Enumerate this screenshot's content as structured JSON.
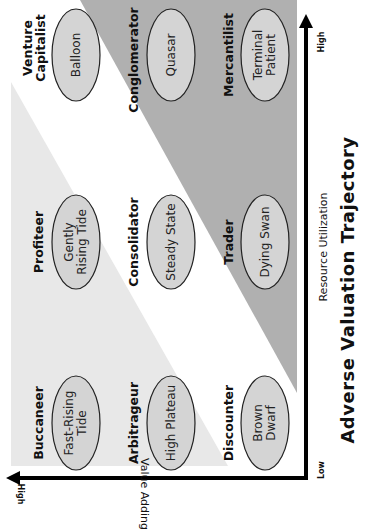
{
  "title": "Adverse Valuation Trajectory",
  "colors": {
    "background": "#ffffff",
    "light_region": "#e8e8e8",
    "dark_region": "#b0b0b0",
    "ellipse_fill": "#d4d4d4",
    "axis": "#000000"
  },
  "axes": {
    "x": {
      "label": "Resource Utilization",
      "low": "Low",
      "high": "High"
    },
    "y": {
      "label": "Value Adding",
      "low": "",
      "high": "High"
    }
  },
  "grid": {
    "rows": [
      {
        "position": "top",
        "cells": [
          {
            "segment": "Venture Capitalist",
            "segment_lines": [
              "Venture",
              "Capitalist"
            ],
            "trajectory": "Balloon",
            "trajectory_lines": [
              "Balloon"
            ]
          },
          {
            "segment": "Conglomerator",
            "segment_lines": [
              "Conglomerator"
            ],
            "trajectory": "Quasar",
            "trajectory_lines": [
              "Quasar"
            ]
          },
          {
            "segment": "Mercantilist",
            "segment_lines": [
              "Mercantilist"
            ],
            "trajectory": "Terminal Patient",
            "trajectory_lines": [
              "Terminal",
              "Patient"
            ]
          }
        ]
      },
      {
        "position": "middle",
        "cells": [
          {
            "segment": "Profiteer",
            "segment_lines": [
              "Profiteer"
            ],
            "trajectory": "Gently Rising Tide",
            "trajectory_lines": [
              "Gently",
              "Rising Tide"
            ]
          },
          {
            "segment": "Consolidator",
            "segment_lines": [
              "Consolidator"
            ],
            "trajectory": "Steady State",
            "trajectory_lines": [
              "Steady State"
            ]
          },
          {
            "segment": "Trader",
            "segment_lines": [
              "Trader"
            ],
            "trajectory": "Dying Swan",
            "trajectory_lines": [
              "Dying Swan"
            ]
          }
        ]
      },
      {
        "position": "bottom",
        "cells": [
          {
            "segment": "Buccaneer",
            "segment_lines": [
              "Buccaneer"
            ],
            "trajectory": "Fast-Rising Tide",
            "trajectory_lines": [
              "Fast-Rising",
              "Tide"
            ]
          },
          {
            "segment": "Arbitrageur",
            "segment_lines": [
              "Arbitrageur"
            ],
            "trajectory": "High Plateau",
            "trajectory_lines": [
              "High Plateau"
            ]
          },
          {
            "segment": "Discounter",
            "segment_lines": [
              "Discounter"
            ],
            "trajectory": "Brown Dwarf",
            "trajectory_lines": [
              "Brown",
              "Dwarf"
            ]
          }
        ]
      }
    ]
  }
}
